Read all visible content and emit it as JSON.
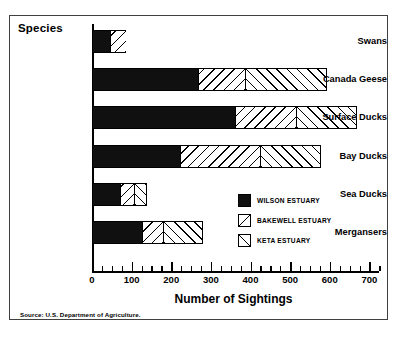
{
  "figure": {
    "y_axis_title": "Species",
    "x_axis_title": "Number of Sightings",
    "source_note": "Source: U.S. Department of Agriculture."
  },
  "legend": {
    "items": [
      {
        "label": "WILSON ESTUARY",
        "key": "wilson",
        "pattern": "solid-black",
        "color": "#101010"
      },
      {
        "label": "BAKEWELL ESTUARY",
        "key": "bakewell",
        "pattern": "backslash-hatch",
        "color": "#ffffff"
      },
      {
        "label": "KETA ESTUARY",
        "key": "keta",
        "pattern": "forwardslash-hatch",
        "color": "#ffffff"
      }
    ]
  },
  "axis": {
    "tick_labels": [
      "0",
      "100",
      "200",
      "300",
      "400",
      "500",
      "600",
      "700"
    ],
    "tick_values": [
      0,
      100,
      200,
      300,
      400,
      500,
      600,
      700
    ],
    "minor_tick_step": 25,
    "xmin": 0,
    "xmax": 700
  },
  "chart_data": {
    "type": "bar",
    "orientation": "horizontal",
    "stacked": true,
    "title": "",
    "xlabel": "Number of Sightings",
    "ylabel": "Species",
    "xlim": [
      0,
      700
    ],
    "grid": false,
    "legend_position": "inside-right",
    "categories": [
      "Swans",
      "Canada Geese",
      "Surface Ducks",
      "Bay Ducks",
      "Sea Ducks",
      "Mergansers"
    ],
    "series": [
      {
        "name": "WILSON ESTUARY",
        "values": [
          45,
          268,
          360,
          223,
          70,
          125
        ]
      },
      {
        "name": "BAKEWELL ESTUARY",
        "values": [
          40,
          117,
          155,
          200,
          35,
          55
        ]
      },
      {
        "name": "KETA ESTUARY",
        "values": [
          0,
          207,
          153,
          155,
          33,
          100
        ]
      }
    ],
    "totals": [
      85,
      592,
      668,
      578,
      138,
      280
    ],
    "source": "Source: U.S. Department of Agriculture."
  }
}
